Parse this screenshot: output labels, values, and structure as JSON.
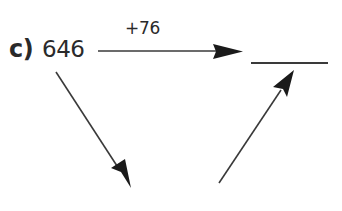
{
  "exercise": {
    "label": "c)",
    "start_number": "646",
    "operation": "+76",
    "answer": ""
  },
  "arrows": [
    {
      "name": "horizontal-arrow",
      "from": [
        98,
        51
      ],
      "to": [
        243,
        51
      ],
      "direction": "right"
    },
    {
      "name": "down-arrow",
      "from": [
        56,
        72
      ],
      "to": [
        131,
        188
      ],
      "direction": "down-right"
    },
    {
      "name": "up-arrow",
      "from": [
        219,
        183
      ],
      "to": [
        294,
        70
      ],
      "direction": "up-right"
    }
  ],
  "colors": {
    "ink": "#2a2a2a",
    "background": "#ffffff"
  }
}
